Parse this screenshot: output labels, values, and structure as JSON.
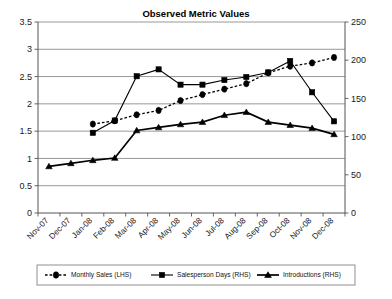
{
  "chart_data": {
    "type": "line",
    "title": "Observed Metric Values",
    "xlabel": "",
    "ylabel": "",
    "grid": true,
    "legend_position": "bottom",
    "categories": [
      "Nov-07",
      "Dec-07",
      "Jan-08",
      "Feb-08",
      "Mar-08",
      "Apr-08",
      "May-08",
      "Jun-08",
      "Jul-08",
      "Aug-08",
      "Sep-08",
      "Oct-08",
      "Nov-08",
      "Dec-08"
    ],
    "left_axis": {
      "label": "",
      "ylim": [
        0,
        3.5
      ],
      "ticks": [
        "0",
        "0.5",
        "1",
        "1.5",
        "2",
        "2.5",
        "3",
        "3.5"
      ],
      "tick_values": [
        0,
        0.5,
        1,
        1.5,
        2,
        2.5,
        3,
        3.5
      ]
    },
    "right_axis": {
      "label": "",
      "ylim": [
        0,
        250
      ],
      "ticks": [
        "0",
        "50",
        "100",
        "150",
        "200",
        "250"
      ],
      "tick_values": [
        0,
        50,
        100,
        150,
        200,
        250
      ]
    },
    "series": [
      {
        "name": "Monthly Sales (LHS)",
        "axis": "left",
        "marker": "diamond",
        "line_style": "dotted",
        "x": [
          "Jan-08",
          "Feb-08",
          "Mar-08",
          "Apr-08",
          "May-08",
          "Jun-08",
          "Jul-08",
          "Aug-08",
          "Sep-08",
          "Oct-08",
          "Nov-08",
          "Dec-08"
        ],
        "values": [
          1.63,
          1.69,
          1.8,
          1.88,
          2.06,
          2.17,
          2.27,
          2.37,
          2.57,
          2.69,
          2.75,
          2.85
        ]
      },
      {
        "name": "Salesperson Days (RHS)",
        "axis": "right",
        "marker": "square",
        "line_style": "solid",
        "x": [
          "Jan-08",
          "Feb-08",
          "Mar-08",
          "Apr-08",
          "May-08",
          "Jun-08",
          "Jul-08",
          "Aug-08",
          "Sep-08",
          "Oct-08",
          "Nov-08",
          "Dec-08"
        ],
        "values": [
          105,
          121,
          179,
          188,
          168,
          168,
          174,
          178,
          184,
          199,
          158,
          120
        ]
      },
      {
        "name": "Introductions (RHS)",
        "axis": "right",
        "marker": "triangle",
        "line_style": "thick-solid",
        "x": [
          "Nov-07",
          "Dec-07",
          "Jan-08",
          "Feb-08",
          "Mar-08",
          "Apr-08",
          "May-08",
          "Jun-08",
          "Jul-08",
          "Aug-08",
          "Sep-08",
          "Oct-08",
          "Nov-08",
          "Dec-08"
        ],
        "values": [
          61,
          65,
          69,
          72,
          108,
          112,
          116,
          119,
          128,
          132,
          119,
          115,
          111,
          103
        ]
      }
    ]
  },
  "legend": {
    "items": [
      {
        "label": "Monthly Sales (LHS)",
        "marker": "diamond",
        "line_style": "dotted"
      },
      {
        "label": "Salesperson Days (RHS)",
        "marker": "square",
        "line_style": "solid"
      },
      {
        "label": "Introductions (RHS)",
        "marker": "triangle",
        "line_style": "thick-solid"
      }
    ]
  },
  "colors": {
    "series": "#000000",
    "grid": "#8c8c8c",
    "axis": "#555555",
    "background": "#ffffff"
  }
}
